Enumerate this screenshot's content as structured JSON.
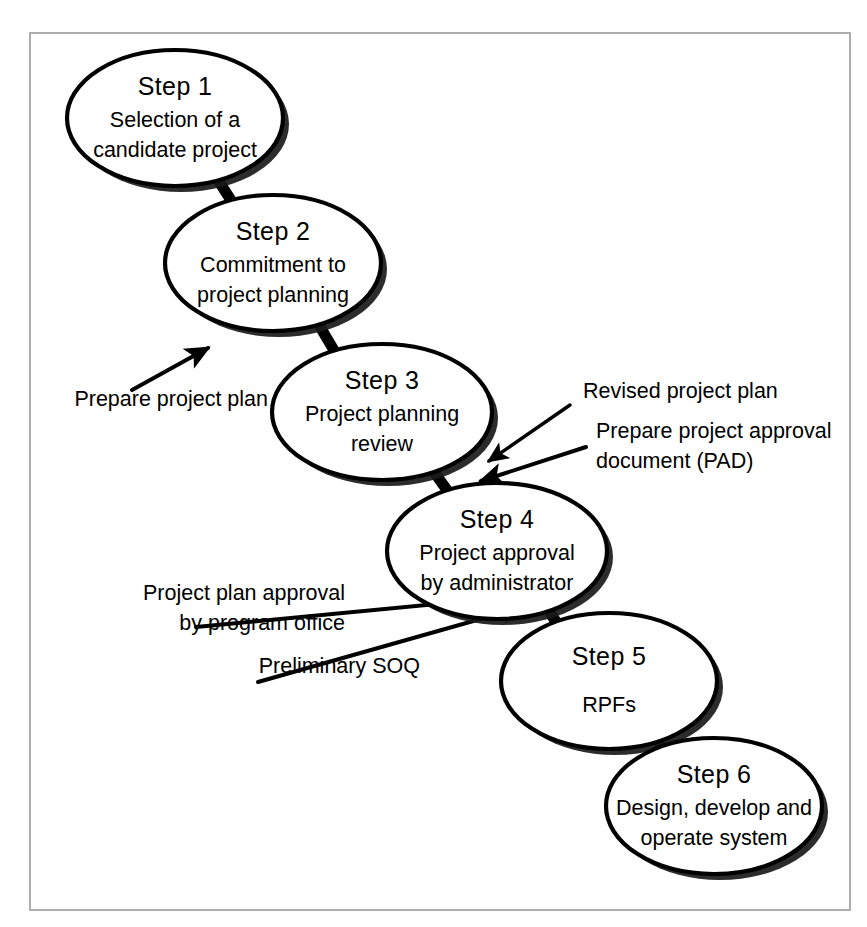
{
  "diagram": {
    "type": "flowchart",
    "background_color": "#ffffff",
    "frame": {
      "name": "figure-border",
      "color": "#9a9a9a",
      "x": 30,
      "y": 33,
      "width": 820,
      "height": 877
    },
    "style": {
      "node_fill": "#ffffff",
      "node_stroke": "#000000",
      "shadow_color": "#1a1a1a",
      "connector_color": "#000000",
      "text_color": "#000000"
    },
    "nodes": [
      {
        "id": "step-1",
        "title": "Step 1",
        "lines": [
          "Selection of a",
          "candidate project"
        ],
        "cx": 175,
        "cy": 118,
        "rx": 108,
        "ry": 68
      },
      {
        "id": "step-2",
        "title": "Step 2",
        "lines": [
          "Commitment to",
          "project planning"
        ],
        "cx": 273,
        "cy": 263,
        "rx": 108,
        "ry": 68
      },
      {
        "id": "step-3",
        "title": "Step 3",
        "lines": [
          "Project planning",
          "review"
        ],
        "cx": 382,
        "cy": 412,
        "rx": 110,
        "ry": 68
      },
      {
        "id": "step-4",
        "title": "Step 4",
        "lines": [
          "Project approval",
          "by administrator"
        ],
        "cx": 497,
        "cy": 551,
        "rx": 110,
        "ry": 68
      },
      {
        "id": "step-5",
        "title": "Step 5",
        "lines": [
          "RPFs"
        ],
        "cx": 609,
        "cy": 681,
        "rx": 108,
        "ry": 68
      },
      {
        "id": "step-6",
        "title": "Step 6",
        "lines": [
          "Design, develop and",
          "operate system"
        ],
        "cx": 714,
        "cy": 806,
        "rx": 108,
        "ry": 68
      }
    ],
    "connectors": [
      {
        "id": "conn-1-2",
        "from": "step-1",
        "to": "step-2",
        "x1": 218,
        "y1": 180,
        "x2": 236,
        "y2": 208
      },
      {
        "id": "conn-2-3",
        "from": "step-2",
        "to": "step-3",
        "x1": 319,
        "y1": 325,
        "x2": 335,
        "y2": 352
      },
      {
        "id": "conn-3-4",
        "from": "step-3",
        "to": "step-4",
        "x1": 434,
        "y1": 472,
        "x2": 452,
        "y2": 497
      },
      {
        "id": "conn-4-5",
        "from": "step-4",
        "to": "step-5",
        "x1": 548,
        "y1": 610,
        "x2": 566,
        "y2": 636
      },
      {
        "id": "conn-5-6",
        "from": "step-5",
        "to": "step-6",
        "x1": 657,
        "y1": 740,
        "x2": 674,
        "y2": 764
      }
    ],
    "annotations": [
      {
        "id": "annot-prepare-project-plan",
        "lines": [
          "Prepare project plan"
        ],
        "align": "left",
        "text_x": 268,
        "text_y": 406,
        "arrow": {
          "x1": 132,
          "y1": 390,
          "x2": 212,
          "y2": 346,
          "arrowhead": true
        }
      },
      {
        "id": "annot-revised-project-plan",
        "lines": [
          "Revised project plan"
        ],
        "align": "right",
        "text_x": 583,
        "text_y": 398,
        "arrow": {
          "x1": 570,
          "y1": 405,
          "x2": 486,
          "y2": 463,
          "arrowhead": true
        }
      },
      {
        "id": "annot-prepare-pad",
        "lines": [
          "Prepare project approval",
          "document (PAD)"
        ],
        "align": "right",
        "text_x": 596,
        "text_y": 438,
        "arrow": {
          "x1": 586,
          "y1": 447,
          "x2": 478,
          "y2": 482,
          "arrowhead": true
        }
      },
      {
        "id": "annot-project-plan-approval",
        "lines": [
          "Project plan approval",
          "by program office"
        ],
        "align": "left",
        "text_x": 345,
        "text_y": 600,
        "arrow": {
          "x1": 196,
          "y1": 627,
          "x2": 524,
          "y2": 594,
          "arrowhead": true
        }
      },
      {
        "id": "annot-preliminary-soq",
        "lines": [
          "Preliminary SOQ"
        ],
        "align": "left",
        "text_x": 420,
        "text_y": 673,
        "arrow": {
          "x1": 258,
          "y1": 682,
          "x2": 527,
          "y2": 604,
          "arrowhead": true
        }
      }
    ]
  }
}
